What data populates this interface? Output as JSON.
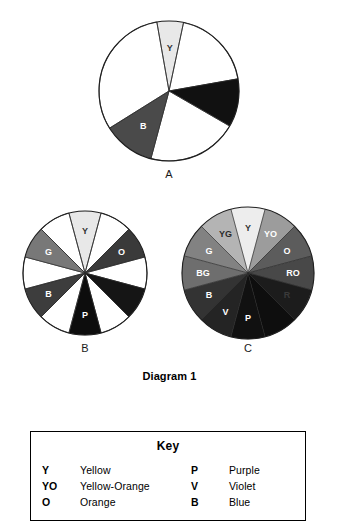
{
  "diagram": {
    "caption": "Diagram 1",
    "wheels": [
      {
        "id": "A",
        "label": "A",
        "center": {
          "x": 169,
          "y": 91
        },
        "radius": 70,
        "segments": [
          {
            "label": "Y",
            "start": -100,
            "end": -78,
            "fill": "#e8e8e8",
            "text": "#333333",
            "show_label": true
          },
          {
            "label": "",
            "start": -78,
            "end": -10,
            "fill": "#ffffff",
            "text": "#000000",
            "show_label": false
          },
          {
            "label": "",
            "start": -10,
            "end": 30,
            "fill": "#111111",
            "text": "#ffffff",
            "show_label": false
          },
          {
            "label": "",
            "start": 30,
            "end": 105,
            "fill": "#ffffff",
            "text": "#000000",
            "show_label": false
          },
          {
            "label": "B",
            "start": 105,
            "end": 148,
            "fill": "#4a4a4a",
            "text": "#ffffff",
            "show_label": true
          },
          {
            "label": "",
            "start": 148,
            "end": 260,
            "fill": "#ffffff",
            "text": "#000000",
            "show_label": false
          }
        ]
      },
      {
        "id": "B",
        "label": "B",
        "center": {
          "x": 85,
          "y": 273
        },
        "radius": 62,
        "segments": [
          {
            "label": "Y",
            "start": -105,
            "end": -75,
            "fill": "#e8e8e8",
            "text": "#333333",
            "show_label": true
          },
          {
            "label": "",
            "start": -75,
            "end": -45,
            "fill": "#ffffff",
            "text": "#000000",
            "show_label": false
          },
          {
            "label": "O",
            "start": -45,
            "end": -15,
            "fill": "#3a3a3a",
            "text": "#ffffff",
            "show_label": true
          },
          {
            "label": "",
            "start": -15,
            "end": 15,
            "fill": "#ffffff",
            "text": "#000000",
            "show_label": false
          },
          {
            "label": "",
            "start": 15,
            "end": 45,
            "fill": "#151515",
            "text": "#ffffff",
            "show_label": false
          },
          {
            "label": "",
            "start": 45,
            "end": 75,
            "fill": "#ffffff",
            "text": "#000000",
            "show_label": false
          },
          {
            "label": "P",
            "start": 75,
            "end": 105,
            "fill": "#0d0d0d",
            "text": "#ffffff",
            "show_label": true
          },
          {
            "label": "",
            "start": 105,
            "end": 135,
            "fill": "#ffffff",
            "text": "#000000",
            "show_label": false
          },
          {
            "label": "B",
            "start": 135,
            "end": 165,
            "fill": "#3d3d3d",
            "text": "#ffffff",
            "show_label": true
          },
          {
            "label": "",
            "start": 165,
            "end": 195,
            "fill": "#ffffff",
            "text": "#000000",
            "show_label": false
          },
          {
            "label": "G",
            "start": 195,
            "end": 225,
            "fill": "#787878",
            "text": "#ffffff",
            "show_label": true
          },
          {
            "label": "",
            "start": 225,
            "end": 255,
            "fill": "#ffffff",
            "text": "#000000",
            "show_label": false
          }
        ]
      },
      {
        "id": "C",
        "label": "C",
        "center": {
          "x": 248,
          "y": 273
        },
        "radius": 66,
        "segments": [
          {
            "label": "Y",
            "start": -105,
            "end": -75,
            "fill": "#ededed",
            "text": "#333333",
            "show_label": true
          },
          {
            "label": "YO",
            "start": -75,
            "end": -45,
            "fill": "#9c9c9c",
            "text": "#ffffff",
            "show_label": true
          },
          {
            "label": "O",
            "start": -45,
            "end": -15,
            "fill": "#5c5c5c",
            "text": "#ffffff",
            "show_label": true
          },
          {
            "label": "RO",
            "start": -15,
            "end": 15,
            "fill": "#484848",
            "text": "#ffffff",
            "show_label": true
          },
          {
            "label": "R",
            "start": 15,
            "end": 45,
            "fill": "#1c1c1c",
            "text": "#3a3a3a",
            "show_label": true
          },
          {
            "label": "",
            "start": 45,
            "end": 75,
            "fill": "#0e0e0e",
            "text": "#ffffff",
            "show_label": false
          },
          {
            "label": "P",
            "start": 75,
            "end": 105,
            "fill": "#111111",
            "text": "#ffffff",
            "show_label": true
          },
          {
            "label": "V",
            "start": 105,
            "end": 135,
            "fill": "#242424",
            "text": "#ffffff",
            "show_label": true
          },
          {
            "label": "B",
            "start": 135,
            "end": 165,
            "fill": "#333333",
            "text": "#ffffff",
            "show_label": true
          },
          {
            "label": "BG",
            "start": 165,
            "end": 195,
            "fill": "#6e6e6e",
            "text": "#ffffff",
            "show_label": true
          },
          {
            "label": "G",
            "start": 195,
            "end": 225,
            "fill": "#828282",
            "text": "#ffffff",
            "show_label": true
          },
          {
            "label": "YG",
            "start": 225,
            "end": 255,
            "fill": "#b4b4b4",
            "text": "#2a2a2a",
            "show_label": true
          }
        ]
      }
    ]
  },
  "key": {
    "title": "Key",
    "entries_left": [
      {
        "abbr": "Y",
        "name": "Yellow"
      },
      {
        "abbr": "YO",
        "name": "Yellow-Orange"
      },
      {
        "abbr": "O",
        "name": "Orange"
      }
    ],
    "entries_right": [
      {
        "abbr": "P",
        "name": "Purple"
      },
      {
        "abbr": "V",
        "name": "Violet"
      },
      {
        "abbr": "B",
        "name": "Blue"
      }
    ]
  }
}
